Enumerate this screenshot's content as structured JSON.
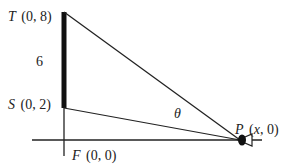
{
  "diagram": {
    "points": {
      "T": {
        "name": "T",
        "coords": "(0, 8)"
      },
      "S": {
        "name": "S",
        "coords": "(0, 2)"
      },
      "F": {
        "name": "F",
        "coords": "(0, 0)"
      },
      "P": {
        "name": "P",
        "coords_open": "(",
        "x": "x",
        "coords_close": ", 0)"
      }
    },
    "segment_length_label": "6",
    "angle_label": "θ",
    "colors": {
      "line": "#222222",
      "background": "#ffffff"
    }
  }
}
